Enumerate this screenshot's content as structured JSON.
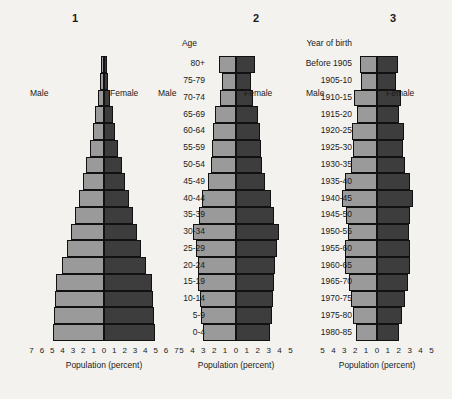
{
  "figure": {
    "background": "#f3f2ee",
    "male_color": "#9a9a9a",
    "female_color": "#3d3d3d"
  },
  "age_groups": [
    "80+",
    "75-79",
    "70-74",
    "65-69",
    "60-64",
    "55-59",
    "50-54",
    "45-49",
    "40-44",
    "35-39",
    "30-34",
    "25-29",
    "20-24",
    "15-19",
    "10-14",
    "5-9",
    "0-4"
  ],
  "year_of_birth": [
    "Before 1905",
    "1905-10",
    "1910-15",
    "1915-20",
    "1920-25",
    "1925-30",
    "1930-35",
    "1935-40",
    "1940-45",
    "1945-50",
    "1950-55",
    "1955-60",
    "1960-65",
    "1965-70",
    "1970-75",
    "1975-80",
    "1980-85"
  ],
  "column_headers": {
    "age": "Age",
    "year_of_birth": "Year of birth"
  },
  "labels": {
    "male": "Male",
    "female": "Female",
    "axis_caption": "Population (percent)"
  },
  "chart_data": [
    {
      "type": "bar",
      "title": "1",
      "subtype": "population-pyramid",
      "orientation": "horizontal-diverging",
      "xlabel": "Population (percent)",
      "ylabel": "Age",
      "xlim": [
        -7,
        7
      ],
      "xticks": [
        7,
        6,
        5,
        4,
        3,
        2,
        1,
        0,
        1,
        2,
        3,
        4,
        5,
        6,
        7
      ],
      "grid": false,
      "legend": [
        "Male",
        "Female"
      ],
      "legend_position": "inside-top",
      "categories": [
        "80+",
        "75-79",
        "70-74",
        "65-69",
        "60-64",
        "55-59",
        "50-54",
        "45-49",
        "40-44",
        "35-39",
        "30-34",
        "25-29",
        "20-24",
        "15-19",
        "10-14",
        "5-9",
        "0-4"
      ],
      "series": [
        {
          "name": "Male",
          "values": [
            0.25,
            0.4,
            0.6,
            0.85,
            1.1,
            1.4,
            1.7,
            2.0,
            2.4,
            2.8,
            3.2,
            3.6,
            4.1,
            4.6,
            4.7,
            4.8,
            4.9
          ]
        },
        {
          "name": "Female",
          "values": [
            0.25,
            0.4,
            0.6,
            0.85,
            1.1,
            1.4,
            1.7,
            2.0,
            2.4,
            2.8,
            3.2,
            3.6,
            4.1,
            4.6,
            4.7,
            4.8,
            4.9
          ]
        }
      ]
    },
    {
      "type": "bar",
      "title": "2",
      "subtype": "population-pyramid",
      "orientation": "horizontal-diverging",
      "xlabel": "Population (percent)",
      "ylabel": "Age",
      "xlim": [
        -5,
        5
      ],
      "xticks": [
        5,
        4,
        3,
        2,
        1,
        0,
        1,
        2,
        3,
        4,
        5
      ],
      "grid": false,
      "legend": [
        "Male",
        "Female"
      ],
      "legend_position": "inside-top",
      "categories": [
        "80+",
        "75-79",
        "70-74",
        "65-69",
        "60-64",
        "55-59",
        "50-54",
        "45-49",
        "40-44",
        "35-39",
        "30-34",
        "25-29",
        "20-24",
        "15-19",
        "10-14",
        "5-9",
        "0-4"
      ],
      "series": [
        {
          "name": "Male",
          "values": [
            1.6,
            1.3,
            1.5,
            1.9,
            2.1,
            2.2,
            2.3,
            2.6,
            3.1,
            3.4,
            3.9,
            3.7,
            3.5,
            3.5,
            3.3,
            3.2,
            3.0
          ]
        },
        {
          "name": "Female",
          "values": [
            1.7,
            1.4,
            1.6,
            2.0,
            2.2,
            2.3,
            2.4,
            2.7,
            3.2,
            3.5,
            3.9,
            3.8,
            3.6,
            3.5,
            3.4,
            3.3,
            3.1
          ]
        }
      ]
    },
    {
      "type": "bar",
      "title": "3",
      "subtype": "population-pyramid",
      "orientation": "horizontal-diverging",
      "xlabel": "Population (percent)",
      "ylabel": "Age",
      "xlim": [
        -5,
        5
      ],
      "xticks": [
        5,
        4,
        3,
        2,
        1,
        0,
        1,
        2,
        3,
        4,
        5
      ],
      "grid": false,
      "legend": [
        "Male",
        "Female"
      ],
      "legend_position": "inside-top",
      "categories": [
        "80+",
        "75-79",
        "70-74",
        "65-69",
        "60-64",
        "55-59",
        "50-54",
        "45-49",
        "40-44",
        "35-39",
        "30-34",
        "25-29",
        "20-24",
        "15-19",
        "10-14",
        "5-9",
        "0-4"
      ],
      "series": [
        {
          "name": "Male",
          "values": [
            1.6,
            1.5,
            2.1,
            1.8,
            2.3,
            2.2,
            2.4,
            2.9,
            3.2,
            2.8,
            2.7,
            2.9,
            2.9,
            2.6,
            2.4,
            2.2,
            1.9
          ]
        },
        {
          "name": "Female",
          "values": [
            1.9,
            1.7,
            2.2,
            2.0,
            2.5,
            2.4,
            2.6,
            3.0,
            3.3,
            3.0,
            2.9,
            3.0,
            3.0,
            2.8,
            2.6,
            2.3,
            2.0
          ]
        }
      ]
    }
  ]
}
